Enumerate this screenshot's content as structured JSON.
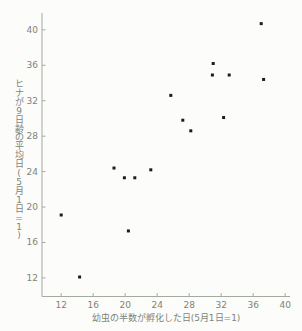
{
  "page": {
    "background": "#fcfcfa"
  },
  "chart_data": {
    "type": "scatter",
    "title": "",
    "xlabel": "幼虫の半数が孵化した日(5月1日=1)",
    "ylabel": "ヒナが9日齢の平均日(5月1日=1)",
    "xlim": [
      9.6,
      40.6
    ],
    "ylim": [
      9.9,
      41.9
    ],
    "xticks": [
      12,
      16,
      20,
      24,
      28,
      32,
      36,
      40
    ],
    "yticks": [
      12,
      16,
      20,
      24,
      28,
      32,
      36,
      40
    ],
    "grid": false,
    "legend_position": "none",
    "marker": "square",
    "colors": {
      "point": "#1c1c1c",
      "axis": "#a3aaa0",
      "tick_label": "#7e8379"
    },
    "points": [
      {
        "x": 12.0,
        "y": 19.1
      },
      {
        "x": 14.3,
        "y": 12.1
      },
      {
        "x": 18.6,
        "y": 24.4
      },
      {
        "x": 19.9,
        "y": 23.3
      },
      {
        "x": 20.4,
        "y": 17.3
      },
      {
        "x": 21.2,
        "y": 23.3
      },
      {
        "x": 23.2,
        "y": 24.2
      },
      {
        "x": 25.7,
        "y": 32.6
      },
      {
        "x": 27.2,
        "y": 29.8
      },
      {
        "x": 28.2,
        "y": 28.6
      },
      {
        "x": 31.0,
        "y": 36.2
      },
      {
        "x": 30.9,
        "y": 34.9
      },
      {
        "x": 33.0,
        "y": 34.9
      },
      {
        "x": 32.3,
        "y": 30.1
      },
      {
        "x": 37.0,
        "y": 40.7
      },
      {
        "x": 37.3,
        "y": 34.4
      }
    ]
  }
}
